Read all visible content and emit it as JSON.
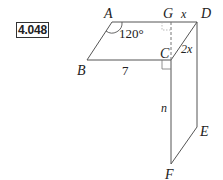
{
  "problem": {
    "number": "4.048"
  },
  "diagram": {
    "points": {
      "A": "A",
      "B": "B",
      "C": "C",
      "D": "D",
      "E": "E",
      "F": "F",
      "G": "G"
    },
    "measures": {
      "angle_A": "120°",
      "BC": "7",
      "GD": "x",
      "CD": "2x",
      "CF": "n"
    },
    "colors": {
      "line": "#555555",
      "text": "#222222",
      "dash": "#777777"
    }
  }
}
